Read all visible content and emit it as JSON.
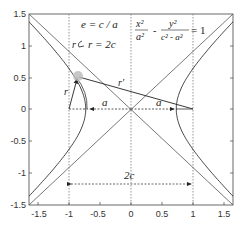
{
  "chart_data": {
    "type": "line",
    "title": "",
    "xlabel": "",
    "ylabel": "",
    "xlim": [
      -1.65,
      1.65
    ],
    "ylim": [
      -1.5,
      1.5
    ],
    "grid": false,
    "x_ticks": [
      "-1.5",
      "-1",
      "-0.5",
      "0",
      "0.5",
      "1",
      "1.5"
    ],
    "y_ticks": [
      "1.5",
      "1",
      "0.5",
      "0",
      "-0.5",
      "-1",
      "-1.5"
    ],
    "parameters": {
      "a": 0.73,
      "c": 1.0,
      "b": 0.68
    },
    "series": [
      {
        "name": "hyperbola right branch",
        "equation": "x^2/a^2 - y^2/(c^2-a^2) = 1",
        "vertex": [
          0.73,
          0
        ]
      },
      {
        "name": "hyperbola left branch",
        "vertex": [
          -0.73,
          0
        ]
      },
      {
        "name": "asymptote 1",
        "from": [
          -1.6,
          -1.5
        ],
        "to": [
          1.6,
          1.5
        ]
      },
      {
        "name": "asymptote 2",
        "from": [
          -1.6,
          1.5
        ],
        "to": [
          1.6,
          -1.5
        ]
      },
      {
        "name": "focus line x=-1",
        "style": "dotted"
      },
      {
        "name": "focus line x=1",
        "style": "dotted"
      },
      {
        "name": "line x=0",
        "style": "dotted"
      }
    ],
    "point_P": [
      -0.9,
      0.5
    ],
    "annotations": [
      {
        "text": "e = c / a",
        "position": [
          -0.85,
          1.3
        ]
      },
      {
        "text": "r = 2c",
        "position": [
          -0.8,
          1.0
        ]
      },
      {
        "text": "x²/a² − y²/(c² − a²) = 1",
        "position": [
          0.05,
          1.3
        ]
      },
      {
        "text": "r",
        "position": [
          -1.0,
          0.3
        ]
      },
      {
        "text": "r'",
        "position": [
          -0.35,
          0.45
        ]
      },
      {
        "text": "a",
        "position": [
          -0.45,
          0.05
        ]
      },
      {
        "text": "a",
        "position": [
          0.5,
          0.05
        ]
      },
      {
        "text": "2c",
        "position": [
          0,
          -0.95
        ]
      }
    ]
  },
  "labels": {
    "eq1": "e = c / a",
    "eq2_prefix": "r",
    "eq2": "r = 2c",
    "hyperbola_x_num": "x²",
    "hyperbola_x_den": "a²",
    "hyperbola_minus": "-",
    "hyperbola_y_num": "y²",
    "hyperbola_y_den": "c² - a²",
    "hyperbola_eq": "= 1",
    "r": "r",
    "r_prime": "r'",
    "a_left": "a",
    "a_right": "a",
    "two_c": "2c"
  },
  "ticks": {
    "x": [
      "-1.5",
      "-1",
      "-0.5",
      "0",
      "0.5",
      "1",
      "1.5"
    ],
    "y": [
      "1.5",
      "1",
      "0.5",
      "0",
      "-0.5",
      "-1",
      "-1.5"
    ]
  }
}
